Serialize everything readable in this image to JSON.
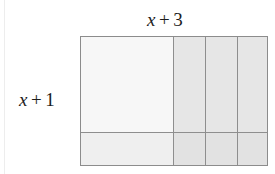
{
  "figure": {
    "kind": "area-model-diagram",
    "top_label": {
      "variable": "x",
      "operator": "+",
      "constant": "3",
      "text": "x + 3"
    },
    "left_label": {
      "variable": "x",
      "operator": "+",
      "constant": "1",
      "text": "x + 1"
    },
    "colors": {
      "border": "#8c8c8c",
      "divider": "#8e8e8e",
      "background": "#ffffff",
      "text": "#1c1c1c",
      "fill_x_squared": "#f7f7f7",
      "fill_x_column": "#e6e6e6",
      "fill_x_row": "#efefef",
      "fill_unit": "#e2e2e2"
    },
    "grid": {
      "columns": [
        {
          "name": "x",
          "width_units": "x"
        },
        {
          "name": "unit-1",
          "width_units": "1"
        },
        {
          "name": "unit-2",
          "width_units": "1"
        },
        {
          "name": "unit-3",
          "width_units": "1"
        }
      ],
      "rows": [
        {
          "name": "x",
          "height_units": "x"
        },
        {
          "name": "unit-1",
          "height_units": "1"
        }
      ]
    },
    "cells": [
      {
        "id": "x-squared",
        "row": "x",
        "column": "x"
      },
      {
        "id": "x-col-1",
        "row": "x",
        "column": "unit-1"
      },
      {
        "id": "x-col-2",
        "row": "x",
        "column": "unit-2"
      },
      {
        "id": "x-col-3",
        "row": "x",
        "column": "unit-3"
      },
      {
        "id": "x-row",
        "row": "unit-1",
        "column": "x"
      },
      {
        "id": "unit-1-1",
        "row": "unit-1",
        "column": "unit-1"
      },
      {
        "id": "unit-1-2",
        "row": "unit-1",
        "column": "unit-2"
      },
      {
        "id": "unit-1-3",
        "row": "unit-1",
        "column": "unit-3"
      }
    ]
  }
}
